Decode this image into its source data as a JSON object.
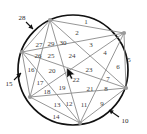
{
  "figure": {
    "type": "geometric-diagram",
    "circle": {
      "cx": 73,
      "cy": 70,
      "r": 55,
      "stroke": "#111111",
      "stroke_width": 1.7,
      "fill": "#ffffff"
    },
    "chord_color": "#8a8a8a",
    "vertex_color": "#9a9a9a",
    "label_color": "#3c3c3c",
    "vertices": [
      {
        "name": "vertex-top-left",
        "x": 50,
        "y": 20
      },
      {
        "name": "vertex-top-right",
        "x": 124,
        "y": 33
      },
      {
        "name": "vertex-right",
        "x": 126,
        "y": 88
      },
      {
        "name": "vertex-bottom",
        "x": 80,
        "y": 123
      },
      {
        "name": "vertex-left-lower",
        "x": 30,
        "y": 97
      },
      {
        "name": "vertex-left-upper",
        "x": 22,
        "y": 52
      }
    ],
    "chords": [
      [
        0,
        1
      ],
      [
        0,
        2
      ],
      [
        0,
        3
      ],
      [
        0,
        4
      ],
      [
        0,
        5
      ],
      [
        1,
        2
      ],
      [
        1,
        3
      ],
      [
        1,
        4
      ],
      [
        1,
        5
      ],
      [
        2,
        3
      ],
      [
        2,
        4
      ],
      [
        2,
        5
      ],
      [
        3,
        4
      ],
      [
        3,
        5
      ],
      [
        4,
        5
      ]
    ],
    "inner_labels": [
      {
        "id": "1",
        "x": 86,
        "y": 22
      },
      {
        "id": "2",
        "x": 77,
        "y": 33
      },
      {
        "id": "3",
        "x": 91,
        "y": 45
      },
      {
        "id": "4",
        "x": 105,
        "y": 53
      },
      {
        "id": "5",
        "x": 129,
        "y": 60
      },
      {
        "id": "6",
        "x": 118,
        "y": 67
      },
      {
        "id": "7",
        "x": 108,
        "y": 79
      },
      {
        "id": "8",
        "x": 106,
        "y": 89
      },
      {
        "id": "9",
        "x": 102,
        "y": 104
      },
      {
        "id": "11",
        "x": 84,
        "y": 105
      },
      {
        "id": "12",
        "x": 69,
        "y": 104
      },
      {
        "id": "13",
        "x": 57,
        "y": 105
      },
      {
        "id": "14",
        "x": 56,
        "y": 117
      },
      {
        "id": "16",
        "x": 31,
        "y": 70
      },
      {
        "id": "17",
        "x": 40,
        "y": 83
      },
      {
        "id": "18",
        "x": 47,
        "y": 92
      },
      {
        "id": "19",
        "x": 62,
        "y": 88
      },
      {
        "id": "20",
        "x": 52,
        "y": 71
      },
      {
        "id": "21",
        "x": 90,
        "y": 89
      },
      {
        "id": "22",
        "x": 76,
        "y": 80
      },
      {
        "id": "23",
        "x": 89,
        "y": 70
      },
      {
        "id": "24",
        "x": 72,
        "y": 56
      },
      {
        "id": "25",
        "x": 51,
        "y": 56
      },
      {
        "id": "26",
        "x": 38,
        "y": 56
      },
      {
        "id": "27",
        "x": 39,
        "y": 45
      },
      {
        "id": "29",
        "x": 51,
        "y": 44
      },
      {
        "id": "30",
        "x": 63,
        "y": 43
      }
    ],
    "annotated_labels": [
      {
        "id": "10",
        "x": 125,
        "y": 121,
        "arrow": {
          "x1": 119,
          "y1": 117,
          "x2": 109,
          "y2": 110
        }
      },
      {
        "id": "15",
        "x": 9,
        "y": 84,
        "arrow": {
          "x1": 14,
          "y1": 80,
          "x2": 21,
          "y2": 73
        }
      },
      {
        "id": "28",
        "x": 22,
        "y": 18,
        "arrow": {
          "x1": 26,
          "y1": 22,
          "x2": 33,
          "y2": 29
        }
      }
    ],
    "cursor": {
      "name": "mouse-pointer",
      "x": 66,
      "y": 67
    }
  }
}
